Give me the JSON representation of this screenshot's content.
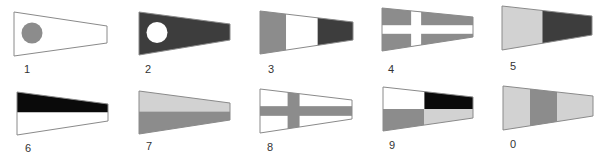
{
  "colors": {
    "white": "#ffffff",
    "outline": "#8a8a8a",
    "mid_gray": "#8c8c8c",
    "dark_gray": "#3d3d3d",
    "black": "#0a0a0a",
    "light_gray": "#d2d2d2"
  },
  "flags": [
    {
      "label": "1",
      "x": 14,
      "y": 12,
      "w": 93,
      "h": 44,
      "tip": [
        14,
        31
      ],
      "lx": 24,
      "ly": 64,
      "design": "circle",
      "field": "white",
      "circle": "mid_gray"
    },
    {
      "label": "2",
      "x": 139,
      "y": 12,
      "w": 91,
      "h": 43,
      "tip": [
        12,
        28
      ],
      "lx": 145,
      "ly": 64,
      "design": "circle",
      "field": "dark_gray",
      "circle": "white"
    },
    {
      "label": "3",
      "x": 260,
      "y": 11,
      "w": 93,
      "h": 43,
      "tip": [
        11,
        29
      ],
      "lx": 268,
      "ly": 64,
      "design": "vbands",
      "bands": [
        "mid_gray",
        "white",
        "dark_gray"
      ],
      "splits": [
        0.28,
        0.62
      ]
    },
    {
      "label": "4",
      "x": 382,
      "y": 8,
      "w": 91,
      "h": 43,
      "tip": [
        9,
        29
      ],
      "lx": 388,
      "ly": 64,
      "design": "cross",
      "field": "mid_gray",
      "cross": "white",
      "cx": 0.32,
      "cw": 0.11,
      "ch": 0.2
    },
    {
      "label": "5",
      "x": 502,
      "y": 6,
      "w": 90,
      "h": 44,
      "tip": [
        10,
        29
      ],
      "lx": 510,
      "ly": 61,
      "design": "vbands",
      "bands": [
        "light_gray",
        "dark_gray"
      ],
      "splits": [
        0.45
      ]
    },
    {
      "label": "6",
      "x": 17,
      "y": 92,
      "w": 91,
      "h": 43,
      "tip": [
        12,
        29
      ],
      "lx": 25,
      "ly": 143,
      "design": "hsplit",
      "top": "black",
      "bottom": "white"
    },
    {
      "label": "7",
      "x": 139,
      "y": 91,
      "w": 91,
      "h": 43,
      "tip": [
        12,
        29
      ],
      "lx": 146,
      "ly": 141,
      "design": "hsplit",
      "top": "light_gray",
      "bottom": "mid_gray"
    },
    {
      "label": "8",
      "x": 260,
      "y": 89,
      "w": 92,
      "h": 44,
      "tip": [
        11,
        30
      ],
      "lx": 267,
      "ly": 142,
      "design": "cross",
      "field": "white",
      "cross": "mid_gray",
      "cx": 0.3,
      "cw": 0.13,
      "ch": 0.22
    },
    {
      "label": "9",
      "x": 383,
      "y": 87,
      "w": 90,
      "h": 44,
      "tip": [
        10,
        31
      ],
      "lx": 389,
      "ly": 140,
      "design": "quarters",
      "tl": "white",
      "tr": "black",
      "bl": "mid_gray",
      "br": "light_gray",
      "split": 0.46
    },
    {
      "label": "0",
      "x": 503,
      "y": 86,
      "w": 90,
      "h": 44,
      "tip": [
        10,
        30
      ],
      "lx": 510,
      "ly": 139,
      "design": "vbands",
      "bands": [
        "light_gray",
        "mid_gray",
        "light_gray"
      ],
      "splits": [
        0.3,
        0.6
      ]
    }
  ]
}
